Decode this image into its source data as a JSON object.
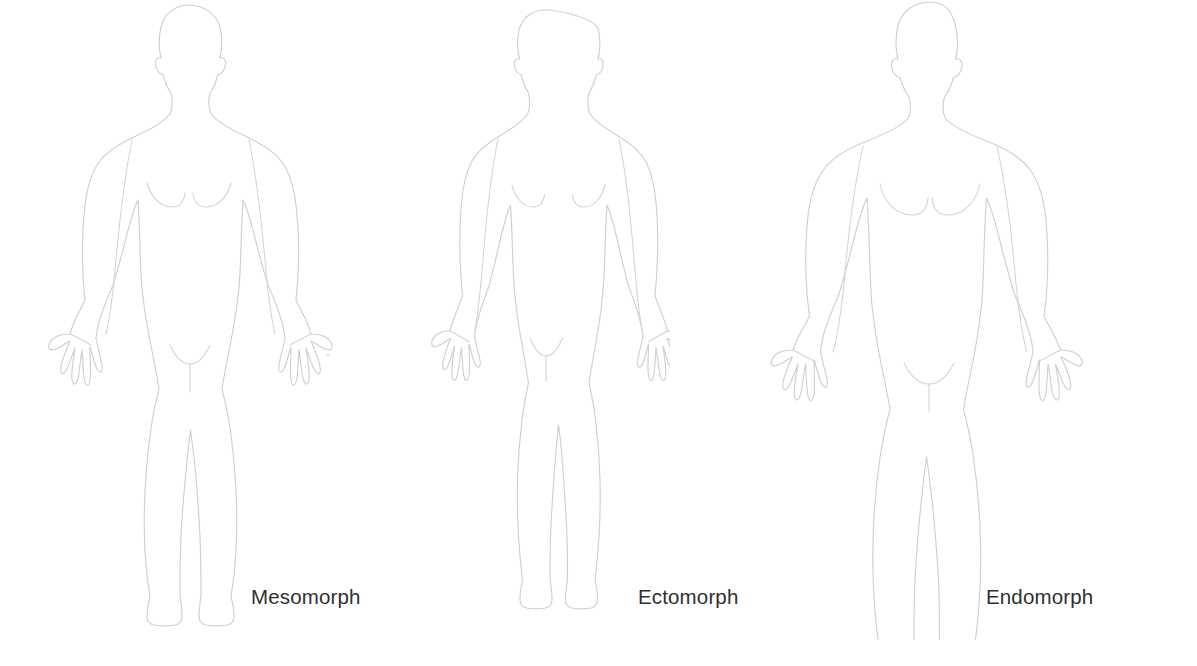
{
  "canvas": {
    "width": 1197,
    "height": 666,
    "background_color": "#ffffff"
  },
  "illustration": {
    "title_text": "",
    "subject": "female-body-somatotypes",
    "figure_count": 3,
    "outline_color": "#cfcfd2",
    "label_color": "#2f2f2f",
    "label_font_size_px": 20.5
  },
  "figures": [
    {
      "id": "mesomorph",
      "label": "Mesomorph",
      "label_left_px": 251,
      "label_top_px": 587,
      "figure_left_px": 44,
      "figure_width_px": 290,
      "figure_height_px": 600,
      "build": "athletic-medium",
      "view": "front",
      "arms": "spread-hands-open",
      "pose_note": "standing, arms slightly away from body, fingers spread"
    },
    {
      "id": "ectomorph",
      "label": "Ectomorph",
      "label_left_px": 638,
      "label_top_px": 587,
      "figure_left_px": 420,
      "figure_width_px": 250,
      "figure_height_px": 600,
      "build": "slim-narrow",
      "view": "front",
      "arms": "spread-hands-open",
      "pose_note": "standing, slender limbs, narrow hips and shoulders"
    },
    {
      "id": "endomorph",
      "label": "Endomorph",
      "label_left_px": 986,
      "label_top_px": 587,
      "figure_left_px": 770,
      "figure_width_px": 320,
      "figure_height_px": 600,
      "build": "full-wide",
      "view": "front",
      "arms": "spread-hands-open",
      "pose_note": "standing, broader shoulders, fuller torso, thighs and hips"
    }
  ]
}
